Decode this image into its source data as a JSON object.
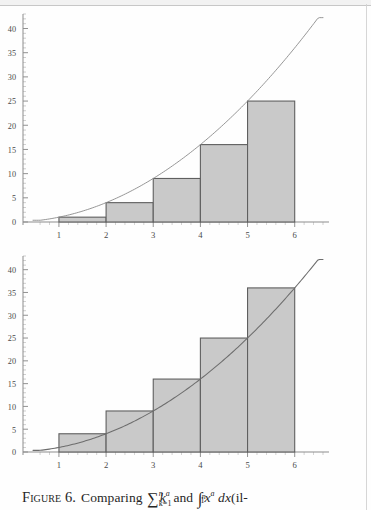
{
  "figure": {
    "caption_label": "Figure 6.",
    "caption_text_before": "Comparing",
    "caption_text_middle": "and",
    "caption_text_after": "(il-",
    "sum_symbol": "∑",
    "sum_upper": "n",
    "sum_lower": "k=1",
    "sum_body": "k",
    "sum_body_exponent": "a",
    "integral_symbol": "∫",
    "integral_upper": "n",
    "integral_lower": "1",
    "integral_body": "x",
    "integral_body_exponent": "a",
    "integral_differential": "dx"
  },
  "style": {
    "bar_fill": "#c9c9c9",
    "bar_stroke": "#5f5f5f",
    "curve_color": "#8a8a8a",
    "curve_color_dark": "#6d6d6d",
    "axis_color": "#8d8d8d",
    "tick_label_color": "#4a4a4a",
    "page_background": "#fefefe"
  },
  "chart_data": [
    {
      "type": "bar",
      "title": "",
      "subtitle": "lower sum: left-endpoint rectangles under y = x^a",
      "xlabel": "",
      "ylabel": "",
      "categories": [
        "1",
        "2",
        "3",
        "4",
        "5",
        "6"
      ],
      "xticks": [
        1,
        2,
        3,
        4,
        5,
        6
      ],
      "xtick_labels": [
        "1",
        "2",
        "3",
        "4",
        "5",
        "6"
      ],
      "yticks": [
        0,
        5,
        10,
        15,
        20,
        25,
        30,
        35,
        40
      ],
      "ytick_labels": [
        "0",
        "5",
        "10",
        "15",
        "20",
        "25",
        "30",
        "35",
        "40"
      ],
      "xlim": [
        0.45,
        6.6
      ],
      "ylim": [
        0,
        43
      ],
      "grid": false,
      "legend": "none",
      "bars": [
        {
          "x_start": 1,
          "x_end": 2,
          "height": 1
        },
        {
          "x_start": 2,
          "x_end": 3,
          "height": 4
        },
        {
          "x_start": 3,
          "x_end": 4,
          "height": 9
        },
        {
          "x_start": 4,
          "x_end": 5,
          "height": 16
        },
        {
          "x_start": 5,
          "x_end": 6,
          "height": 25
        }
      ],
      "values": [
        1,
        4,
        9,
        16,
        25
      ],
      "series": [
        {
          "name": "y = x^2",
          "type": "line",
          "x": [
            0.6,
            1,
            1.5,
            2,
            2.5,
            3,
            3.5,
            4,
            4.5,
            5,
            5.5,
            6,
            6.5
          ],
          "values": [
            0.36,
            1,
            2.25,
            4,
            6.25,
            9,
            12.25,
            16,
            20.25,
            25,
            30.25,
            36,
            42.25
          ]
        }
      ]
    },
    {
      "type": "bar",
      "title": "",
      "subtitle": "upper sum: right-endpoint rectangles over y = x^a",
      "xlabel": "",
      "ylabel": "",
      "categories": [
        "1",
        "2",
        "3",
        "4",
        "5",
        "6"
      ],
      "xticks": [
        1,
        2,
        3,
        4,
        5,
        6
      ],
      "xtick_labels": [
        "1",
        "2",
        "3",
        "4",
        "5",
        "6"
      ],
      "yticks": [
        0,
        5,
        10,
        15,
        20,
        25,
        30,
        35,
        40
      ],
      "ytick_labels": [
        "0",
        "5",
        "10",
        "15",
        "20",
        "25",
        "30",
        "35",
        "40"
      ],
      "xlim": [
        0.45,
        6.6
      ],
      "ylim": [
        0,
        43
      ],
      "grid": false,
      "legend": "none",
      "bars": [
        {
          "x_start": 1,
          "x_end": 2,
          "height": 4
        },
        {
          "x_start": 2,
          "x_end": 3,
          "height": 9
        },
        {
          "x_start": 3,
          "x_end": 4,
          "height": 16
        },
        {
          "x_start": 4,
          "x_end": 5,
          "height": 25
        },
        {
          "x_start": 5,
          "x_end": 6,
          "height": 36
        }
      ],
      "values": [
        4,
        9,
        16,
        25,
        36
      ],
      "series": [
        {
          "name": "y = x^2",
          "type": "line",
          "x": [
            0.6,
            1,
            1.5,
            2,
            2.5,
            3,
            3.5,
            4,
            4.5,
            5,
            5.5,
            6,
            6.5
          ],
          "values": [
            0.36,
            1,
            2.25,
            4,
            6.25,
            9,
            12.25,
            16,
            20.25,
            25,
            30.25,
            36,
            42.25
          ]
        }
      ]
    }
  ]
}
